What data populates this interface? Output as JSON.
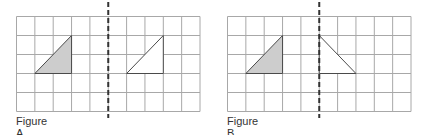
{
  "colors": {
    "grid_line": "#a8a8a8",
    "shape_stroke": "#4a4a4a",
    "shaded_fill": "#cdcdcd",
    "unshaded_fill": "#ffffff",
    "dashed_line": "#333333"
  },
  "grid": {
    "columns": 10,
    "rows": 5
  },
  "figures": [
    {
      "label": "Figure A",
      "mirror_line_column": 5,
      "shaded_triangle": [
        [
          1,
          3
        ],
        [
          3,
          1
        ],
        [
          3,
          3
        ]
      ],
      "image_triangle": [
        [
          6,
          3
        ],
        [
          8,
          1
        ],
        [
          8,
          3
        ]
      ],
      "transformation": "translation"
    },
    {
      "label": "Figure B",
      "mirror_line_column": 5,
      "shaded_triangle": [
        [
          1,
          3
        ],
        [
          3,
          1
        ],
        [
          3,
          3
        ]
      ],
      "image_triangle": [
        [
          5,
          1
        ],
        [
          5,
          3
        ],
        [
          7,
          3
        ]
      ],
      "transformation": "reflection"
    }
  ]
}
